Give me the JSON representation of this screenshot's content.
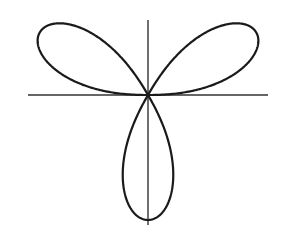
{
  "diagram": {
    "type": "polar-rose",
    "petals": 3,
    "petal_angles_deg": [
      30,
      150,
      270
    ],
    "colors": {
      "curve": "#1a1a1a",
      "axis": "#333333",
      "background": "#ffffff"
    }
  }
}
